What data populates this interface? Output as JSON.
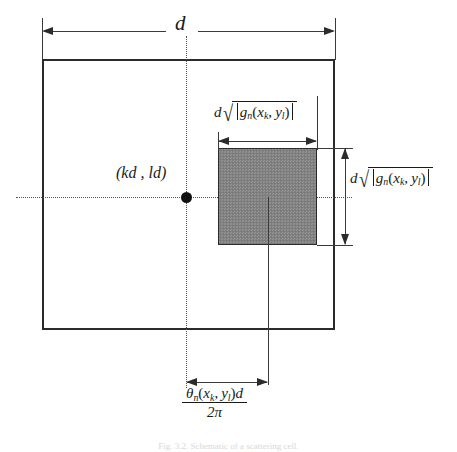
{
  "figure": {
    "type": "technical-diagram",
    "background_color": "#ffffff",
    "line_color": "#2b2b2b",
    "shade_color": "#858585",
    "caption": "Fig. 3.2. Schematic of a scattering cell."
  },
  "labels": {
    "overall_width": "d",
    "center_point": "(kd , ld)",
    "cell_width_prefix": "d",
    "cell_height_prefix": "d",
    "function_name": "g",
    "function_subscript": "n",
    "arg_x": "x",
    "arg_x_subscript": "k",
    "arg_y": "y",
    "arg_y_subscript": "l",
    "offset_numerator_theta": "θ",
    "offset_numerator_subscript": "n",
    "offset_numerator_suffix": "d",
    "offset_denominator": "2π",
    "comma": ",",
    "paren_open": "(",
    "paren_close": ")",
    "surd": "√"
  },
  "geometry": {
    "outer_square": {
      "x": 42,
      "y": 59,
      "width": 293,
      "height": 271
    },
    "shaded_square": {
      "x": 218,
      "y": 148,
      "width": 99,
      "height": 97
    },
    "center_marker": {
      "x": 186,
      "y": 197
    },
    "top_dimension": {
      "y": 31,
      "x_start": 42,
      "x_end": 335,
      "label": "d"
    },
    "cell_width_dimension": {
      "y": 141,
      "x_start": 218,
      "x_end": 317
    },
    "cell_height_dimension": {
      "x": 345,
      "y_start": 148,
      "y_end": 245
    },
    "offset_dimension": {
      "y": 382,
      "x_start": 186,
      "x_end": 268
    }
  }
}
